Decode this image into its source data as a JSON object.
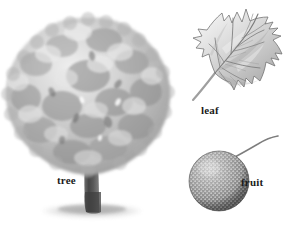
{
  "plate": {
    "title": "Sycamore botanical plate",
    "background_color": "#ffffff",
    "ink_color": "#1b1b1b",
    "medium": "grayscale pencil illustration",
    "width": 292,
    "height": 225
  },
  "figures": [
    {
      "key": "tree",
      "label": "tree",
      "icon": "tree-illustration",
      "description": "Full tree habit with broad rounded mottled gray canopy, dark forking trunk and soft ground shadow",
      "tones": {
        "canopy_light": "#e2e2e2",
        "canopy_mid": "#b9b9b9",
        "canopy_dark": "#8f8f8f",
        "canopy_shadow": "#6e6e6e",
        "trunk_light": "#8c8c8c",
        "trunk_dark": "#4a4a4a",
        "ground_shadow": "#c9c9c9"
      }
    },
    {
      "key": "leaf",
      "label": "leaf",
      "icon": "leaf-illustration",
      "description": "Palmate five-lobed leaf with toothed pointed lobes, pinnate venation and long slender petiole",
      "tones": {
        "blade_light": "#ededed",
        "blade_mid": "#c6c6c6",
        "blade_dark": "#9a9a9a",
        "vein": "#7e7e7e",
        "outline": "#6a6a6a",
        "petiole": "#9c9c9c"
      }
    },
    {
      "key": "fruit",
      "label": "fruit",
      "icon": "fruit-illustration",
      "description": "Spherical bristly seed ball with dense granular texture hanging from a long curved stalk",
      "tones": {
        "ball_light": "#d2d2d2",
        "ball_mid": "#9d9d9d",
        "ball_dark": "#6a6a6a",
        "bump": "#e6e6e6",
        "stalk": "#8a8a8a"
      }
    }
  ]
}
